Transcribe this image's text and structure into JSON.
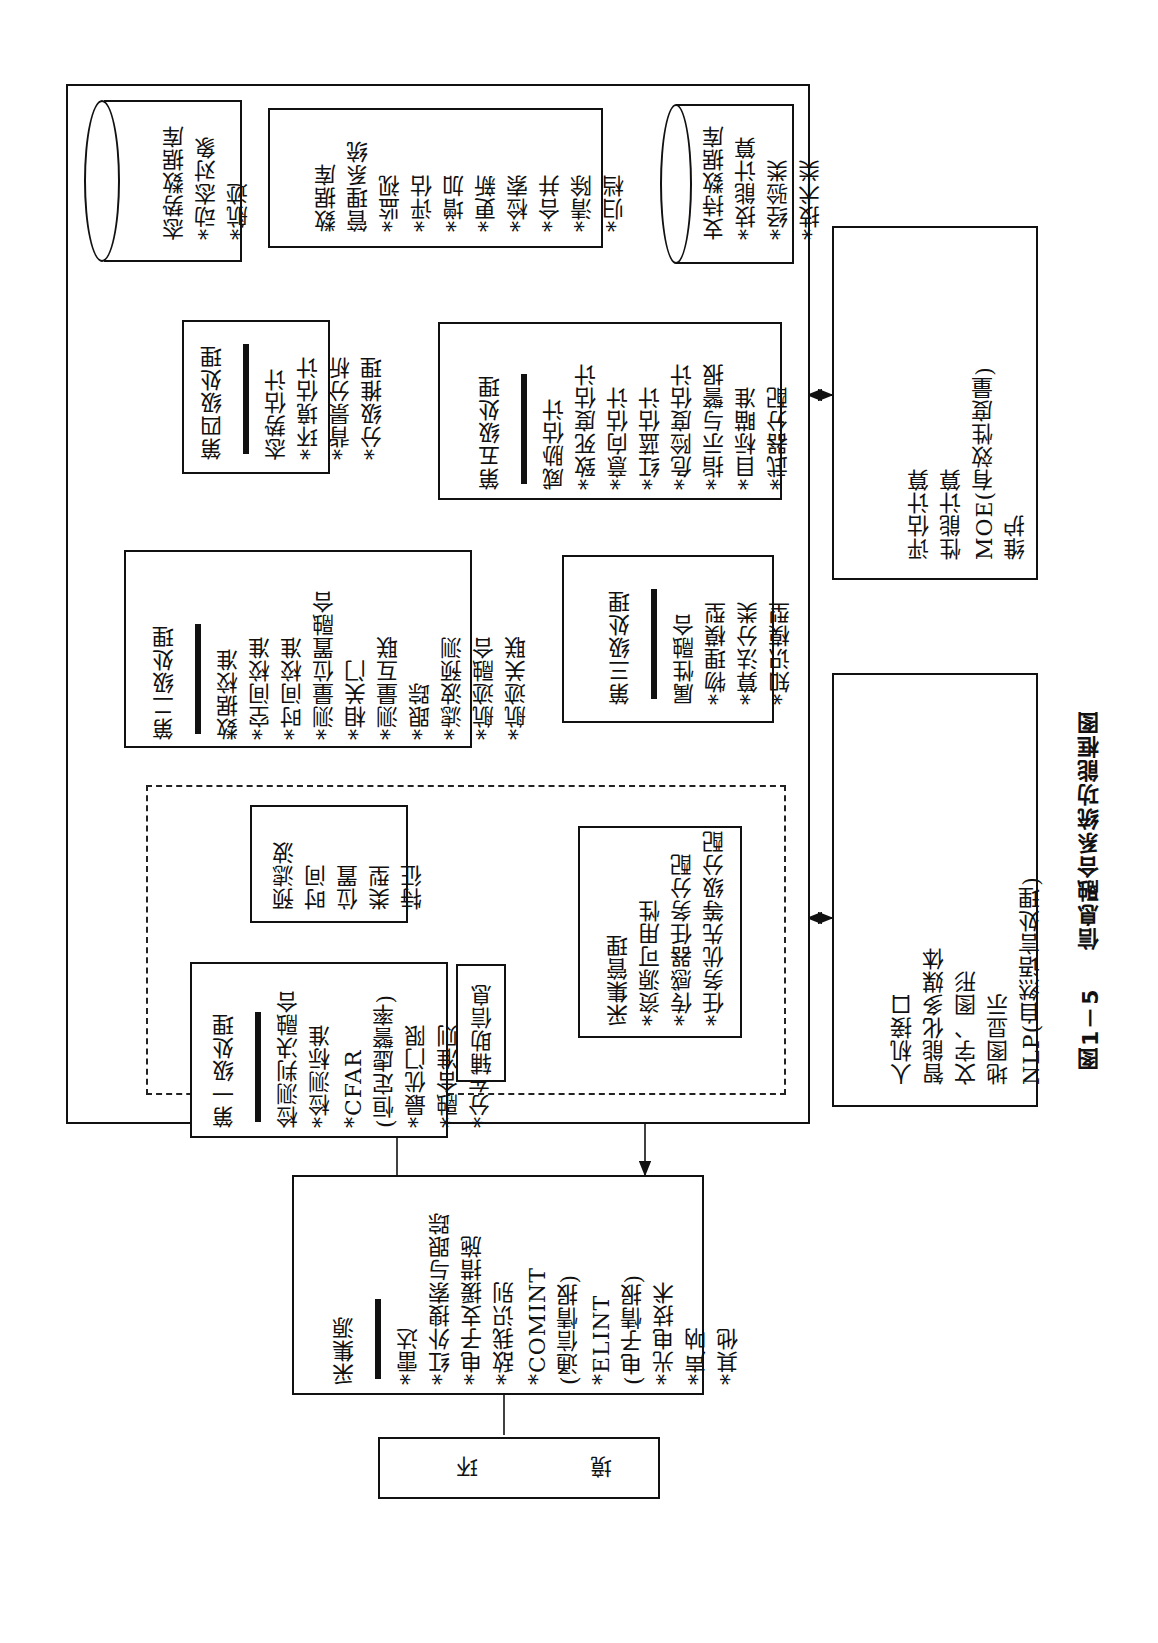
{
  "figure": {
    "caption_label": "图1－5",
    "caption_title": "信息融合系统功能框图",
    "orientation": "rotated 90° counter-clockwise"
  },
  "situation_db": {
    "title": "态势数据库",
    "items": [
      "*动态对象",
      "*航迹"
    ]
  },
  "dbms": {
    "title_lines": [
      "数据库",
      "管理系统"
    ],
    "items": [
      "*监视",
      "*评估",
      "*增加",
      "*更新",
      "*检索",
      "*合并",
      "*清除",
      "*归档"
    ]
  },
  "support_db": {
    "title": "支持数据库",
    "items": [
      "*技能计算",
      "*经验类",
      "*技术类"
    ]
  },
  "level4": {
    "title": "第四级处理",
    "items": [
      "态势估计",
      "*环境估计",
      "*背景分析",
      "*分级推理"
    ]
  },
  "level5": {
    "title": "第五级处理",
    "items": [
      "威胁估计",
      "*致死度估计",
      "*意向估计",
      "*红蓝估计",
      "*危险度估计",
      "*指示与警报",
      "*目标瞄准",
      "*武器分配"
    ]
  },
  "level2": {
    "title": "第二级处理",
    "items": [
      "数据校准",
      "*空间校准",
      "*时间校准",
      "*测量位置融合",
      "*相关门",
      "*测量互联",
      "*跟踪",
      "*滤波预测",
      "*航迹融合",
      "*航迹关联"
    ]
  },
  "level3": {
    "title": "第三级处理",
    "items": [
      "属性融合",
      "*物理模型",
      "*算法分类",
      "*知识模型"
    ]
  },
  "prefilter": {
    "items": [
      "预滤波",
      "时间",
      "位置",
      "类型",
      "特征"
    ]
  },
  "level1": {
    "title": "第一级处理",
    "items": [
      "检测判决融合",
      "*检测标准",
      "*CFAR",
      "(恒定虚警率)",
      "*最优门限",
      "*融合准则",
      "*分布CFAR"
    ]
  },
  "aux_info": {
    "label": "辅助信息"
  },
  "collection_mgmt": {
    "items": [
      "采集管理",
      "*资源可用性",
      "*传感器任务分配",
      "*任务优先等级分配"
    ]
  },
  "sources": {
    "title": "采集源",
    "items": [
      "*雷达",
      "*红外搜索与跟踪",
      "*电子支援措施",
      "*敌我识别",
      "*COMINT",
      "(通信情报)",
      "*ELINT",
      "(电子情报)",
      "*光电技术",
      "*声呐",
      "*其他"
    ]
  },
  "environment": {
    "chars": [
      "环",
      "境"
    ]
  },
  "evaluation": {
    "items": [
      "评估计算",
      "性能计算",
      "MOE(有效性度量)",
      "维护"
    ]
  },
  "hmi": {
    "items": [
      "人机接口",
      "智能化多媒体",
      "文字、图形",
      "地图显示",
      "NLP(自然语言处理)"
    ]
  }
}
